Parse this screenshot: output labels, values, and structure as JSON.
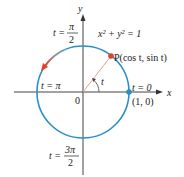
{
  "diagram": {
    "equation": "x² + y² = 1",
    "axes": {
      "x_label": "x",
      "y_label": "y",
      "origin_label": "0"
    },
    "point_P": {
      "label": "P(cos t, sin t)",
      "color": "#d9472b"
    },
    "angle_label": "t",
    "start_point": {
      "label": "(1, 0)",
      "color": "#2a8fc9"
    },
    "parameter_labels": {
      "t0": {
        "lhs": "t =",
        "value": "0"
      },
      "t_half_pi": {
        "lhs": "t =",
        "num": "π",
        "den": "2"
      },
      "t_pi": {
        "lhs": "t =",
        "value": "π"
      },
      "t_three_half_pi": {
        "lhs": "t =",
        "num": "3π",
        "den": "2"
      }
    },
    "colors": {
      "circle": "#2a8fc9",
      "axes": "#333333",
      "radius": "#e8a08a",
      "direction_arrow": "#e05a3a"
    }
  }
}
